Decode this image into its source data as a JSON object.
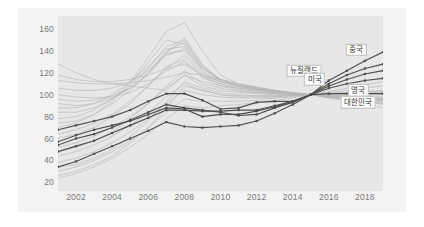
{
  "chart_data": {
    "type": "line",
    "title": "",
    "subtitle": "",
    "xlabel": "",
    "ylabel": "",
    "xlim": [
      2001,
      2019
    ],
    "ylim": [
      12,
      172
    ],
    "grid": false,
    "legend_position": "inline-right-labels",
    "index_base": {
      "year": 2015,
      "value": 100
    },
    "x": [
      2001,
      2002,
      2003,
      2004,
      2005,
      2006,
      2007,
      2008,
      2009,
      2010,
      2011,
      2012,
      2013,
      2014,
      2015,
      2016,
      2017,
      2018,
      2019
    ],
    "ytick_labels": [
      "20",
      "40",
      "60",
      "80",
      "100",
      "120",
      "140",
      "160"
    ],
    "ytick_values": [
      20,
      40,
      60,
      80,
      100,
      120,
      140,
      160
    ],
    "xtick_labels": [
      "2002",
      "2004",
      "2006",
      "2008",
      "2010",
      "2012",
      "2014",
      "2016",
      "2018"
    ],
    "xtick_values": [
      2002,
      2004,
      2006,
      2008,
      2010,
      2012,
      2014,
      2016,
      2018
    ],
    "highlight_color": "#4d4d4d",
    "background_series_color": "#b6b6b6",
    "plot_background": "#e7e7e7",
    "card_background": "#f3f3f3",
    "page_background": "#ffffff",
    "tick_label_color": "#7a7a7a",
    "series": [
      {
        "name": "중국",
        "label": "중국",
        "highlighted": true,
        "label_year": 2018.1,
        "label_value": 141,
        "values": [
          68,
          72,
          76,
          80,
          86,
          94,
          101,
          101,
          95,
          87,
          88,
          93,
          94,
          94,
          100,
          113,
          122,
          131,
          139
        ]
      },
      {
        "name": "뉴질랜드",
        "label": "뉴질랜드",
        "highlighted": true,
        "label_year": 2015.6,
        "label_value": 122,
        "values": [
          54,
          60,
          64,
          70,
          77,
          84,
          91,
          88,
          86,
          84,
          81,
          82,
          88,
          93,
          100,
          110,
          118,
          124,
          128
        ]
      },
      {
        "name": "미국",
        "label": "미국",
        "highlighted": true,
        "label_year": 2015.8,
        "label_value": 114,
        "values": [
          48,
          53,
          58,
          65,
          72,
          79,
          86,
          86,
          85,
          85,
          86,
          86,
          90,
          94,
          100,
          108,
          114,
          119,
          122
        ]
      },
      {
        "name": "영국",
        "label": "영국",
        "highlighted": true,
        "label_year": 2018.2,
        "label_value": 104,
        "values": [
          57,
          63,
          68,
          72,
          76,
          82,
          88,
          87,
          80,
          82,
          82,
          85,
          89,
          94,
          100,
          106,
          110,
          113,
          115
        ]
      },
      {
        "name": "대한민국",
        "label": "대한민국",
        "highlighted": true,
        "label_year": 2018.6,
        "label_value": 93,
        "values": [
          34,
          39,
          46,
          53,
          60,
          67,
          75,
          71,
          70,
          71,
          72,
          76,
          83,
          91,
          100,
          101,
          101,
          101,
          101
        ]
      }
    ],
    "background_series": [
      {
        "name": "bg-01",
        "values": [
          128,
          120,
          114,
          110,
          108,
          106,
          104,
          118,
          112,
          108,
          106,
          104,
          102,
          101,
          100,
          99,
          98,
          96,
          95
        ]
      },
      {
        "name": "bg-02",
        "values": [
          113,
          111,
          110,
          110,
          111,
          113,
          116,
          120,
          118,
          114,
          110,
          107,
          104,
          102,
          100,
          99,
          98,
          97,
          96
        ]
      },
      {
        "name": "bg-03",
        "values": [
          96,
          94,
          95,
          99,
          106,
          118,
          138,
          152,
          128,
          112,
          108,
          106,
          104,
          102,
          100,
          97,
          94,
          91,
          88
        ]
      },
      {
        "name": "bg-04",
        "values": [
          78,
          80,
          86,
          96,
          112,
          134,
          158,
          166,
          140,
          118,
          110,
          106,
          104,
          102,
          100,
          98,
          96,
          94,
          92
        ]
      },
      {
        "name": "bg-05",
        "values": [
          70,
          74,
          82,
          94,
          110,
          130,
          150,
          146,
          124,
          114,
          108,
          105,
          103,
          101,
          100,
          98,
          96,
          95,
          94
        ]
      },
      {
        "name": "bg-06",
        "values": [
          88,
          88,
          92,
          100,
          112,
          126,
          142,
          144,
          122,
          112,
          108,
          106,
          103,
          101,
          100,
          98,
          97,
          96,
          95
        ]
      },
      {
        "name": "bg-07",
        "values": [
          60,
          64,
          70,
          80,
          92,
          108,
          126,
          132,
          116,
          108,
          104,
          102,
          101,
          100,
          100,
          99,
          98,
          97,
          96
        ]
      },
      {
        "name": "bg-08",
        "values": [
          52,
          56,
          62,
          70,
          80,
          92,
          106,
          118,
          108,
          104,
          102,
          101,
          100,
          100,
          100,
          100,
          99,
          99,
          98
        ]
      },
      {
        "name": "bg-09",
        "values": [
          44,
          48,
          54,
          62,
          72,
          84,
          98,
          110,
          104,
          100,
          99,
          99,
          99,
          99,
          100,
          100,
          100,
          100,
          100
        ]
      },
      {
        "name": "bg-10",
        "values": [
          38,
          42,
          48,
          56,
          66,
          78,
          92,
          104,
          100,
          98,
          97,
          97,
          98,
          99,
          100,
          101,
          101,
          102,
          102
        ]
      },
      {
        "name": "bg-11",
        "values": [
          30,
          34,
          40,
          48,
          58,
          70,
          84,
          96,
          94,
          94,
          94,
          95,
          97,
          98,
          100,
          102,
          104,
          106,
          108
        ]
      },
      {
        "name": "bg-12",
        "values": [
          24,
          28,
          34,
          42,
          52,
          64,
          78,
          90,
          88,
          90,
          91,
          93,
          95,
          97,
          100,
          103,
          106,
          109,
          112
        ]
      },
      {
        "name": "bg-13",
        "values": [
          100,
          98,
          97,
          98,
          102,
          110,
          122,
          130,
          116,
          110,
          106,
          104,
          102,
          101,
          100,
          99,
          98,
          97,
          96
        ]
      },
      {
        "name": "bg-14",
        "values": [
          106,
          104,
          104,
          106,
          112,
          122,
          136,
          142,
          124,
          114,
          110,
          107,
          104,
          102,
          100,
          98,
          96,
          94,
          92
        ]
      },
      {
        "name": "bg-15",
        "values": [
          92,
          90,
          92,
          97,
          106,
          120,
          140,
          148,
          126,
          114,
          109,
          106,
          103,
          101,
          100,
          98,
          96,
          94,
          92
        ]
      },
      {
        "name": "bg-16",
        "values": [
          84,
          84,
          88,
          96,
          108,
          124,
          144,
          150,
          126,
          114,
          108,
          105,
          103,
          101,
          100,
          98,
          96,
          94,
          91
        ]
      },
      {
        "name": "bg-17",
        "values": [
          64,
          68,
          74,
          82,
          94,
          108,
          124,
          136,
          118,
          110,
          105,
          103,
          101,
          100,
          100,
          99,
          98,
          97,
          96
        ]
      },
      {
        "name": "bg-18",
        "values": [
          48,
          52,
          58,
          66,
          78,
          92,
          108,
          122,
          110,
          106,
          103,
          102,
          101,
          100,
          100,
          100,
          99,
          98,
          97
        ]
      },
      {
        "name": "bg-19",
        "values": [
          118,
          114,
          112,
          112,
          114,
          118,
          124,
          128,
          118,
          112,
          108,
          105,
          103,
          101,
          100,
          98,
          97,
          95,
          94
        ]
      },
      {
        "name": "bg-20",
        "values": [
          34,
          36,
          42,
          50,
          62,
          76,
          94,
          112,
          106,
          102,
          100,
          99,
          99,
          99,
          100,
          101,
          102,
          103,
          104
        ]
      },
      {
        "name": "bg-21",
        "values": [
          26,
          30,
          36,
          44,
          56,
          70,
          88,
          108,
          104,
          100,
          98,
          98,
          98,
          99,
          100,
          101,
          102,
          103,
          103
        ]
      },
      {
        "name": "bg-22",
        "values": [
          74,
          76,
          82,
          92,
          104,
          120,
          138,
          140,
          120,
          112,
          107,
          104,
          102,
          101,
          100,
          98,
          97,
          96,
          94
        ]
      }
    ]
  }
}
